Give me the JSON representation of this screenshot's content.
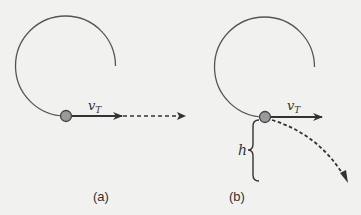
{
  "figure": {
    "panels": [
      {
        "id": "a",
        "caption": "(a)",
        "velocity_label": "v",
        "velocity_subscript": "T",
        "trajectory": "straight dashed line (horizontal)"
      },
      {
        "id": "b",
        "caption": "(b)",
        "velocity_label": "v",
        "velocity_subscript": "T",
        "height_label": "h",
        "trajectory": "curved dashed path (projectile falling)"
      }
    ],
    "colors": {
      "background": "#f1f1ef",
      "line": "#555555",
      "arrow": "#333333",
      "ball_fill": "#9a9a9a",
      "ball_stroke": "#444444"
    }
  }
}
